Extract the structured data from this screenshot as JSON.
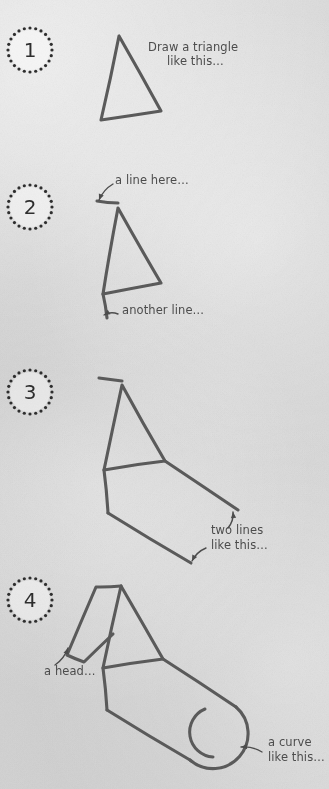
{
  "page": {
    "background_color": "#d8d8d8",
    "ink_color": "#5a5a5a",
    "text_color": "#4c4c4c",
    "badge_color": "#2e2e2e",
    "width": 329,
    "height": 789
  },
  "steps": [
    {
      "number": "1",
      "badge": {
        "cx": 30,
        "cy": 50,
        "r": 22,
        "dot_count": 24,
        "dot_radius": 1.6
      },
      "captions": [
        {
          "text": "Draw a triangle",
          "x": 148,
          "y": 47
        },
        {
          "text": "like this…",
          "x": 167,
          "y": 61
        }
      ],
      "shapes": {
        "triangle": {
          "apex": [
            119,
            36
          ],
          "bottom_left": [
            101,
            120
          ],
          "bottom_right": [
            161,
            111
          ]
        }
      },
      "annotations": []
    },
    {
      "number": "2",
      "badge": {
        "cx": 30,
        "cy": 207,
        "r": 22,
        "dot_count": 24,
        "dot_radius": 1.6
      },
      "captions": [
        {
          "text": "a line here…",
          "x": 115,
          "y": 180
        },
        {
          "text": "another line…",
          "x": 122,
          "y": 310
        }
      ],
      "shapes": {
        "triangle": {
          "apex": [
            118,
            208
          ],
          "bottom_left": [
            103,
            294
          ],
          "bottom_right": [
            161,
            283
          ]
        },
        "top_line": {
          "from": [
            97,
            201
          ],
          "to": [
            118,
            203
          ]
        },
        "left_vertical": {
          "from": [
            103,
            294
          ],
          "to": [
            107,
            318
          ]
        }
      },
      "annotations": [
        {
          "type": "arrow",
          "from": [
            113,
            184
          ],
          "to": [
            99,
            200
          ]
        },
        {
          "type": "arrow",
          "from": [
            118,
            314
          ],
          "to": [
            104,
            315
          ]
        }
      ]
    },
    {
      "number": "3",
      "badge": {
        "cx": 30,
        "cy": 392,
        "r": 22,
        "dot_count": 24,
        "dot_radius": 1.6
      },
      "captions": [
        {
          "text": "two lines",
          "x": 211,
          "y": 530
        },
        {
          "text": "like this…",
          "x": 211,
          "y": 545
        }
      ],
      "shapes": {
        "triangle": {
          "apex": [
            122,
            385
          ],
          "bottom_left": [
            104,
            470
          ],
          "bottom_right": [
            165,
            461
          ]
        },
        "top_line": {
          "from": [
            99,
            378
          ],
          "to": [
            122,
            381
          ]
        },
        "left_vertical": {
          "from": [
            104,
            470
          ],
          "to": [
            108,
            513
          ]
        },
        "line_upper": {
          "from": [
            165,
            461
          ],
          "to": [
            238,
            510
          ]
        },
        "line_lower": {
          "from": [
            108,
            513
          ],
          "to": [
            191,
            563
          ]
        }
      },
      "annotations": [
        {
          "type": "arrow",
          "from": [
            228,
            528
          ],
          "to": [
            233,
            512
          ]
        },
        {
          "type": "arrow",
          "from": [
            206,
            548
          ],
          "to": [
            192,
            561
          ]
        }
      ]
    },
    {
      "number": "4",
      "badge": {
        "cx": 30,
        "cy": 600,
        "r": 22,
        "dot_count": 24,
        "dot_radius": 1.6
      },
      "captions": [
        {
          "text": "a head…",
          "x": 44,
          "y": 671
        },
        {
          "text": "a curve",
          "x": 268,
          "y": 742
        },
        {
          "text": "like this…",
          "x": 268,
          "y": 757
        }
      ],
      "shapes": {
        "triangle": {
          "apex": [
            121,
            586
          ],
          "bottom_left": [
            103,
            668
          ],
          "bottom_right": [
            163,
            659
          ]
        },
        "head": {
          "points": [
            [
              121,
              586
            ],
            [
              96,
              587
            ],
            [
              67,
              655
            ],
            [
              84,
              662
            ],
            [
              113,
              634
            ]
          ]
        },
        "left_vertical": {
          "from": [
            103,
            668
          ],
          "to": [
            107,
            710
          ]
        },
        "body_upper": {
          "from": [
            163,
            659
          ],
          "to": [
            236,
            707
          ]
        },
        "body_lower": {
          "from": [
            107,
            710
          ],
          "to": [
            190,
            760
          ]
        },
        "end_cap": {
          "cx": 213,
          "cy": 733,
          "r": 27,
          "type": "rounded-end"
        },
        "inner_arc": {
          "cx": 203,
          "cy": 734,
          "r": 25
        }
      },
      "annotations": [
        {
          "type": "arrow",
          "from": [
            55,
            665
          ],
          "to": [
            68,
            648
          ]
        },
        {
          "type": "arrow",
          "from": [
            262,
            752
          ],
          "to": [
            241,
            747
          ]
        }
      ]
    }
  ]
}
